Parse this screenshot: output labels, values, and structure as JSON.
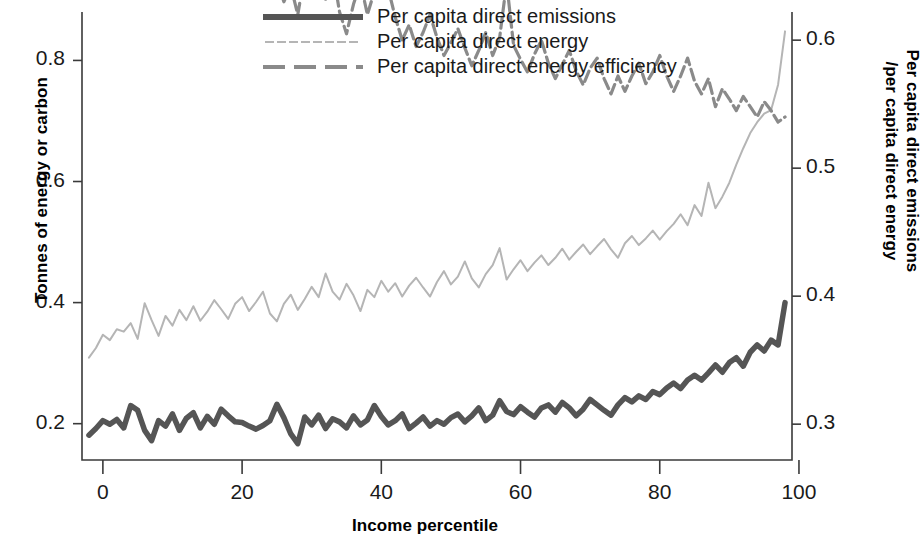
{
  "chart_data": {
    "type": "line",
    "title": "",
    "xlabel": "Income percentile",
    "ylabel": "Tonnes of energy or carbon",
    "ylabel_right": "Per capita direct emissions /per capita direct energy",
    "xlim": [
      -3,
      99
    ],
    "ylim": [
      0.14,
      0.88
    ],
    "ylim_right": [
      0.272,
      0.622
    ],
    "xticks": [
      0,
      20,
      40,
      60,
      80,
      100
    ],
    "xticklabels": [
      "0",
      "20",
      "40",
      "60",
      "80",
      "100"
    ],
    "yticks": [
      0.2,
      0.4,
      0.6,
      0.8
    ],
    "yticklabels": [
      "0.2",
      "0.4",
      "0.6",
      "0.8"
    ],
    "yticks_right": [
      0.3,
      0.4,
      0.5,
      0.6
    ],
    "yticklabels_right": [
      "0.3",
      "0.4",
      "0.5",
      "0.6"
    ],
    "grid": false,
    "legend_position": "top-center",
    "x": [
      -2,
      -1,
      0,
      1,
      2,
      3,
      4,
      5,
      6,
      7,
      8,
      9,
      10,
      11,
      12,
      13,
      14,
      15,
      16,
      17,
      18,
      19,
      20,
      21,
      22,
      23,
      24,
      25,
      26,
      27,
      28,
      29,
      30,
      31,
      32,
      33,
      34,
      35,
      36,
      37,
      38,
      39,
      40,
      41,
      42,
      43,
      44,
      45,
      46,
      47,
      48,
      49,
      50,
      51,
      52,
      53,
      54,
      55,
      56,
      57,
      58,
      59,
      60,
      61,
      62,
      63,
      64,
      65,
      66,
      67,
      68,
      69,
      70,
      71,
      72,
      73,
      74,
      75,
      76,
      77,
      78,
      79,
      80,
      81,
      82,
      83,
      84,
      85,
      86,
      87,
      88,
      89,
      90,
      91,
      92,
      93,
      94,
      95,
      96,
      97,
      98
    ],
    "series": [
      {
        "name": "Per capita direct emissions",
        "axis": "left",
        "color": "#555555",
        "style": "solid-thick",
        "values": [
          0.181,
          0.192,
          0.205,
          0.199,
          0.207,
          0.193,
          0.23,
          0.222,
          0.189,
          0.172,
          0.205,
          0.196,
          0.216,
          0.189,
          0.209,
          0.218,
          0.193,
          0.212,
          0.199,
          0.224,
          0.213,
          0.203,
          0.202,
          0.196,
          0.191,
          0.197,
          0.205,
          0.232,
          0.21,
          0.183,
          0.167,
          0.211,
          0.198,
          0.214,
          0.192,
          0.208,
          0.203,
          0.193,
          0.213,
          0.198,
          0.206,
          0.23,
          0.212,
          0.198,
          0.205,
          0.216,
          0.192,
          0.201,
          0.211,
          0.196,
          0.205,
          0.199,
          0.21,
          0.216,
          0.203,
          0.213,
          0.226,
          0.205,
          0.214,
          0.238,
          0.22,
          0.215,
          0.228,
          0.219,
          0.211,
          0.226,
          0.231,
          0.219,
          0.235,
          0.226,
          0.213,
          0.224,
          0.24,
          0.231,
          0.222,
          0.214,
          0.231,
          0.243,
          0.236,
          0.246,
          0.24,
          0.253,
          0.248,
          0.259,
          0.267,
          0.258,
          0.272,
          0.28,
          0.272,
          0.284,
          0.297,
          0.285,
          0.301,
          0.309,
          0.295,
          0.318,
          0.33,
          0.32,
          0.338,
          0.33,
          0.4
        ]
      },
      {
        "name": "Per capita direct energy",
        "axis": "left",
        "color": "#b5b5b5",
        "style": "thin-solid",
        "values": [
          0.309,
          0.325,
          0.347,
          0.338,
          0.356,
          0.352,
          0.366,
          0.34,
          0.399,
          0.371,
          0.345,
          0.378,
          0.362,
          0.388,
          0.371,
          0.394,
          0.37,
          0.385,
          0.404,
          0.389,
          0.373,
          0.398,
          0.409,
          0.386,
          0.401,
          0.418,
          0.382,
          0.369,
          0.398,
          0.413,
          0.388,
          0.406,
          0.426,
          0.409,
          0.448,
          0.418,
          0.405,
          0.431,
          0.412,
          0.386,
          0.421,
          0.409,
          0.436,
          0.418,
          0.432,
          0.41,
          0.428,
          0.441,
          0.425,
          0.41,
          0.434,
          0.452,
          0.43,
          0.443,
          0.468,
          0.44,
          0.425,
          0.447,
          0.462,
          0.49,
          0.438,
          0.455,
          0.47,
          0.452,
          0.466,
          0.478,
          0.462,
          0.474,
          0.489,
          0.471,
          0.484,
          0.496,
          0.48,
          0.493,
          0.505,
          0.488,
          0.474,
          0.498,
          0.51,
          0.495,
          0.506,
          0.519,
          0.504,
          0.518,
          0.53,
          0.546,
          0.528,
          0.561,
          0.543,
          0.598,
          0.556,
          0.575,
          0.598,
          0.628,
          0.655,
          0.68,
          0.698,
          0.712,
          0.718,
          0.76,
          0.848
        ]
      },
      {
        "name": "Per capita direct energy efficiency",
        "axis": "right",
        "color": "#8a8a8a",
        "style": "dashed",
        "values": [
          0.828,
          0.805,
          0.788,
          0.766,
          0.742,
          0.758,
          0.733,
          0.71,
          0.72,
          0.746,
          0.705,
          0.726,
          0.702,
          0.688,
          0.672,
          0.665,
          0.689,
          0.706,
          0.682,
          0.658,
          0.638,
          0.7,
          0.661,
          0.648,
          0.668,
          0.688,
          0.658,
          0.646,
          0.63,
          0.642,
          0.62,
          0.652,
          0.678,
          0.648,
          0.632,
          0.655,
          0.622,
          0.605,
          0.628,
          0.645,
          0.62,
          0.638,
          0.67,
          0.64,
          0.618,
          0.6,
          0.612,
          0.595,
          0.606,
          0.62,
          0.602,
          0.588,
          0.598,
          0.609,
          0.594,
          0.58,
          0.592,
          0.606,
          0.588,
          0.602,
          0.645,
          0.596,
          0.585,
          0.575,
          0.589,
          0.6,
          0.582,
          0.57,
          0.581,
          0.592,
          0.576,
          0.565,
          0.578,
          0.586,
          0.57,
          0.558,
          0.572,
          0.56,
          0.572,
          0.582,
          0.566,
          0.575,
          0.588,
          0.572,
          0.56,
          0.572,
          0.586,
          0.568,
          0.558,
          0.57,
          0.548,
          0.562,
          0.554,
          0.545,
          0.556,
          0.548,
          0.54,
          0.552,
          0.545,
          0.536,
          0.54
        ]
      }
    ]
  },
  "legend": {
    "items": [
      {
        "label": "Per capita direct emissions"
      },
      {
        "label": "Per capita direct energy"
      },
      {
        "label": "Per capita direct energy efficiency"
      }
    ]
  },
  "axis_titles": {
    "left": "Tonnes of energy or carbon",
    "right_line1": "Per capita direct emissions",
    "right_line2": "/per capita direct energy",
    "bottom": "Income percentile"
  },
  "colors": {
    "emissions": "#555555",
    "energy": "#b5b5b5",
    "efficiency": "#8a8a8a",
    "axis": "#3a3a3a",
    "text": "#1a1a1a"
  }
}
